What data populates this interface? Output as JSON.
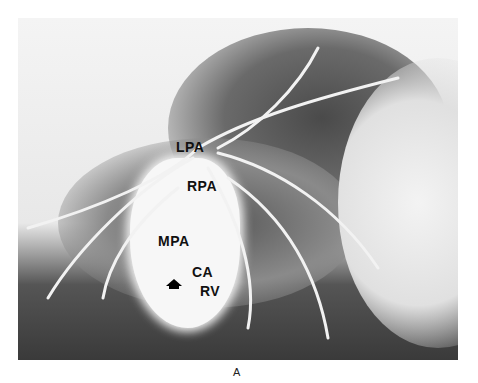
{
  "figure": {
    "caption": "A",
    "labels": {
      "lpa": "LPA",
      "rpa": "RPA",
      "mpa": "MPA",
      "ca": "CA",
      "rv": "RV"
    },
    "colors": {
      "background": "#ffffff",
      "label": "#111111"
    }
  }
}
